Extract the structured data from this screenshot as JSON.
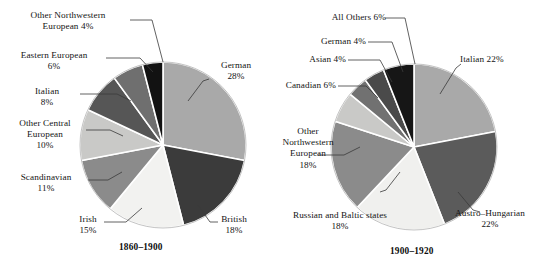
{
  "figure": {
    "title": "",
    "background": "#ffffff"
  },
  "chart_data": [
    {
      "type": "pie",
      "title": "1860–1900",
      "id": "pie-1860-1900",
      "total": 100,
      "start_angle_deg": 0,
      "direction": "clockwise",
      "legend": "callout-labels",
      "categories": [
        "German",
        "British",
        "Irish",
        "Scandinavian",
        "Other Central European",
        "Italian",
        "Eastern European",
        "Other Northwestern European"
      ],
      "values": [
        28,
        18,
        15,
        11,
        10,
        8,
        6,
        4
      ],
      "labels": [
        "German\n28%",
        "British\n18%",
        "Irish\n15%",
        "Scandinavian\n11%",
        "Other Central\nEuropean\n10%",
        "Italian\n8%",
        "Eastern European\n6%",
        "Other Northwestern\nEuropean 4%"
      ],
      "colors": [
        "#a9a9a9",
        "#3b3b3b",
        "#f2f2f0",
        "#8b8b8b",
        "#c9c9c7",
        "#565656",
        "#6f6f6f",
        "#121212"
      ],
      "slice_edge_color": "#ffffff"
    },
    {
      "type": "pie",
      "title": "1900–1920",
      "id": "pie-1900-1920",
      "total": 100,
      "start_angle_deg": 0,
      "direction": "clockwise",
      "legend": "callout-labels",
      "categories": [
        "Italian",
        "Austro-Hungarian",
        "Russian and Baltic states",
        "Other Northwestern European",
        "Canadian",
        "Asian",
        "German",
        "All Others"
      ],
      "values": [
        22,
        22,
        18,
        18,
        6,
        4,
        4,
        6
      ],
      "labels": [
        "Italian 22%",
        "Austro–Hungarian\n22%",
        "Russian and Baltic states\n18%",
        "Other\nNorthwestern\nEuropean\n18%",
        "Canadian 6%",
        "Asian 4%",
        "German 4%",
        "All Others 6%"
      ],
      "colors": [
        "#a9a9a9",
        "#5b5b5b",
        "#f0f0ee",
        "#8b8b8b",
        "#c9c9c7",
        "#717171",
        "#4a4a4a",
        "#161616"
      ],
      "slice_edge_color": "#ffffff"
    }
  ],
  "left": {
    "caption": "1860–1900",
    "labels": {
      "german": "German\n28%",
      "british": "British\n18%",
      "irish": "Irish\n15%",
      "scandinavian": "Scandinavian\n11%",
      "other_central_european": "Other Central\nEuropean\n10%",
      "italian": "Italian\n8%",
      "eastern_european": "Eastern European\n6%",
      "other_northwestern_european": "Other Northwestern\nEuropean 4%"
    }
  },
  "right": {
    "caption": "1900–1920",
    "labels": {
      "italian": "Italian 22%",
      "austro_hungarian": "Austro–Hungarian\n22%",
      "russian_baltic": "Russian and Baltic states\n18%",
      "other_northwestern_european": "Other\nNorthwestern\nEuropean\n18%",
      "canadian": "Canadian 6%",
      "asian": "Asian 4%",
      "german": "German 4%",
      "all_others": "All Others 6%"
    }
  }
}
